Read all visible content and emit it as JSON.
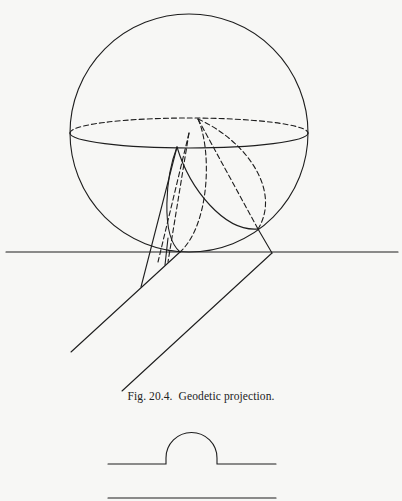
{
  "figure": {
    "caption_label": "Fig. 20.4.",
    "caption_text": "Geodetic projection.",
    "ink_color": "#1e1e1e",
    "paper_color": "#f7f7f5"
  },
  "lower_figure": {
    "description": "Profile line with semicircular bump above a straight baseline"
  }
}
